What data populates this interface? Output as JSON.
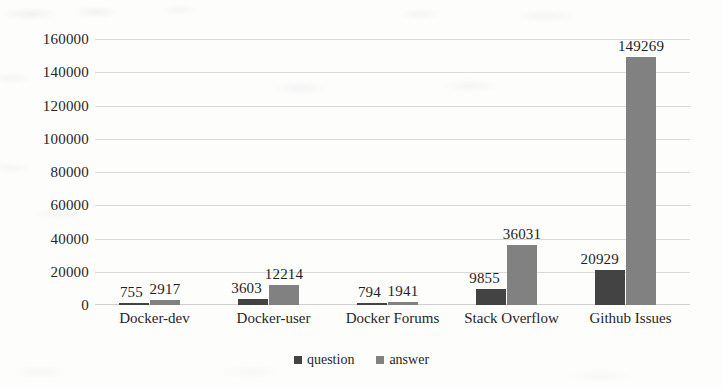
{
  "chart_data": {
    "type": "bar",
    "title": "",
    "subtitle": "",
    "xlabel": "",
    "ylabel": "",
    "ylim": [
      0,
      160000
    ],
    "ytick_step": 20000,
    "yticks": [
      "160000",
      "140000",
      "120000",
      "100000",
      "80000",
      "60000",
      "40000",
      "20000",
      "0"
    ],
    "grid": true,
    "legend_position": "bottom-center",
    "categories": [
      "Docker-dev",
      "Docker-user",
      "Docker Forums",
      "Stack Overflow",
      "Github Issues"
    ],
    "series": [
      {
        "name": "question",
        "color": "#434343",
        "values": [
          755,
          3603,
          794,
          9855,
          20929
        ],
        "labels": [
          "755",
          "3603",
          "794",
          "9855",
          "20929"
        ]
      },
      {
        "name": "answer",
        "color": "#818181",
        "values": [
          2917,
          12214,
          1941,
          36031,
          149269
        ],
        "labels": [
          "2917",
          "12214",
          "1941",
          "36031",
          "149269"
        ]
      }
    ]
  },
  "legend": {
    "items": [
      {
        "label": "question",
        "color": "#434343"
      },
      {
        "label": "answer",
        "color": "#818181"
      }
    ]
  }
}
